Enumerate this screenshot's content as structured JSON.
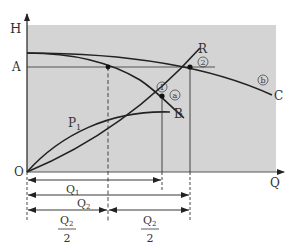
{
  "axes": {
    "y_label": "H",
    "x_label": "Q",
    "origin_label": "O",
    "level_label": "A"
  },
  "curves": {
    "combined_pump_end_label": "C",
    "combined_pump_mark": "b",
    "single_pump_mark": "a",
    "system_curve_label": "R",
    "power_curve_label": "P",
    "power_curve_subscript": "1",
    "power_curve_end_label": "B"
  },
  "points": {
    "point_1": "1",
    "point_2": "2"
  },
  "dimensions": {
    "q1": {
      "main": "Q",
      "sub": "1"
    },
    "q2": {
      "main": "Q",
      "sub": "2"
    },
    "half_q2_left": {
      "num_main": "Q",
      "num_sub": "2",
      "den": "2"
    },
    "half_q2_right": {
      "num_main": "Q",
      "num_sub": "2",
      "den": "2"
    }
  },
  "colors": {
    "plot_background": "#d4d4d4",
    "line": "#222222",
    "text": "#333333"
  }
}
